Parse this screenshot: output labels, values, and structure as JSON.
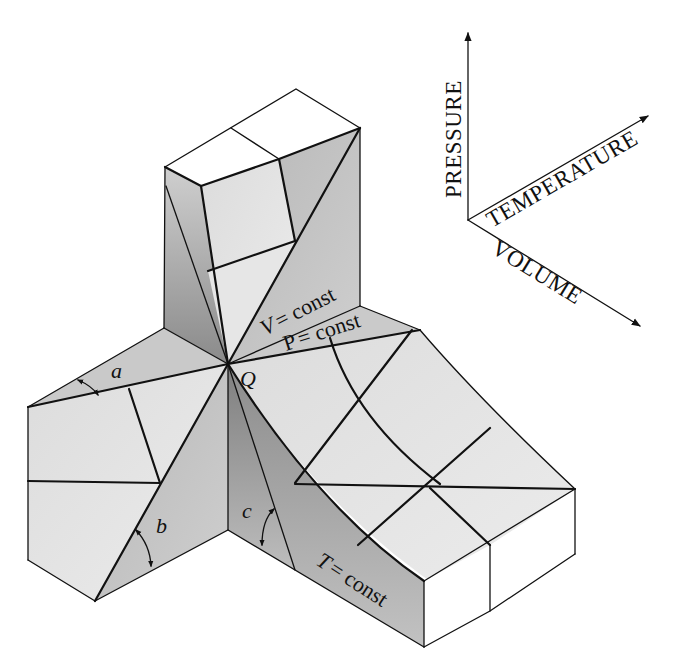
{
  "figure": {
    "type": "isometric PVT surface diagram",
    "axes": {
      "pressure": "PRESSURE",
      "temperature": "TEMPERATURE",
      "volume": "VOLUME"
    },
    "point_label": "Q",
    "curve_labels": {
      "v_const_var": "V",
      "v_const_rest": "= const",
      "p_const_var": "P",
      "p_const_rest": "= const",
      "t_const_var": "T",
      "t_const_rest": "= const"
    },
    "angle_labels": {
      "a": "a",
      "b": "b",
      "c": "c"
    },
    "colors": {
      "background": "#ffffff",
      "face_white": "#ffffff",
      "face_light": "#e4e4e4",
      "face_mid": "#c8c8c8",
      "face_dark": "#9a9a9a",
      "line": "#111111"
    }
  }
}
